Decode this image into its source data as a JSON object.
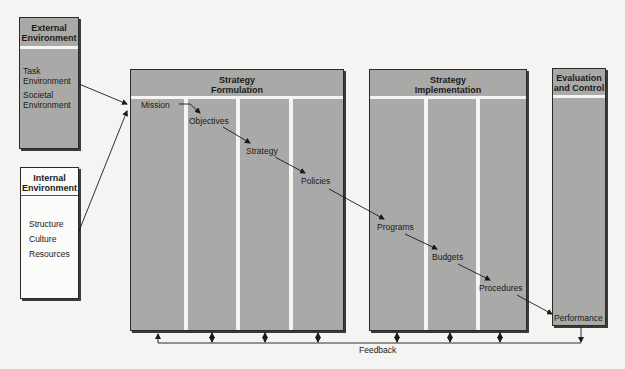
{
  "external": {
    "title_line1": "External",
    "title_line2": "Environment",
    "items": [
      "Task",
      "Environment",
      "Societal",
      "Environment"
    ]
  },
  "internal": {
    "title_line1": "Internal",
    "title_line2": "Environment",
    "items": [
      "Structure",
      "Culture",
      "Resources"
    ]
  },
  "formulation": {
    "title_line1": "Strategy",
    "title_line2": "Formulation",
    "stages": [
      "Mission",
      "Objectives",
      "Strategy",
      "Policies"
    ]
  },
  "implementation": {
    "title_line1": "Strategy",
    "title_line2": "Implementation",
    "stages": [
      "Programs",
      "Budgets",
      "Procedures"
    ]
  },
  "evaluation": {
    "title_line1": "Evaluation",
    "title_line2": "and Control",
    "stages": [
      "Performance"
    ]
  },
  "feedback": {
    "label": "Feedback"
  },
  "colors": {
    "panel_fill": "#a9a9a7",
    "background": "#f4f4f2",
    "line": "#1a1a1a"
  }
}
